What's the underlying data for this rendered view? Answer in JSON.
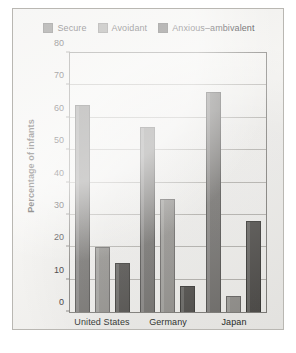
{
  "chart_data": {
    "type": "bar",
    "title": "",
    "xlabel": "",
    "ylabel": "Percentage of infants",
    "ylim": [
      0,
      80
    ],
    "ytick_step": 10,
    "yticks": [
      "80",
      "70",
      "60",
      "50",
      "40",
      "30",
      "20",
      "10",
      "0"
    ],
    "grid": true,
    "legend_position": "top-center",
    "categories": [
      "United States",
      "Germany",
      "Japan"
    ],
    "series": [
      {
        "name": "Secure",
        "color": "#6f6d6a",
        "values": [
          64,
          57,
          68
        ]
      },
      {
        "name": "Avoidant",
        "color": "#918f8b",
        "values": [
          20,
          35,
          5
        ]
      },
      {
        "name": "Anxious–ambivalent",
        "color": "#4b4946",
        "values": [
          15,
          8,
          28
        ]
      }
    ]
  },
  "figure": {
    "background_color": "#f2f1ee",
    "border_color": "#b9b7b2",
    "plot_background_color": "#f4f3f0",
    "axis_color": "#7d7b77",
    "gridline_color": "#b3b1ac"
  }
}
